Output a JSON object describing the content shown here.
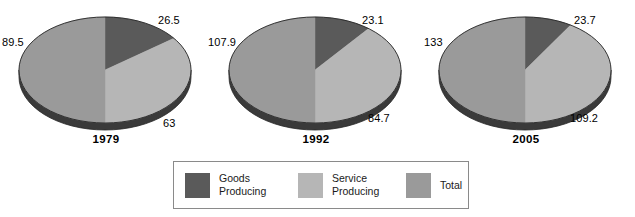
{
  "chart_data": {
    "type": "pie",
    "title": "",
    "subtitle": "",
    "xlabel": "",
    "ylabel": "",
    "legend_position": "bottom",
    "grid": false,
    "categories": [
      "Goods Producing",
      "Service Producing",
      "Total"
    ],
    "colors": {
      "goods_producing": "#5a5a5a",
      "service_producing": "#b6b6b6",
      "total": "#9a9a9a",
      "rim": "#3a3a3a",
      "outline": "#262626"
    },
    "charts": [
      {
        "year": "1979",
        "slices": [
          {
            "name": "Goods Producing",
            "value": 26.5,
            "label": "26.5",
            "color_key": "goods_producing"
          },
          {
            "name": "Service Producing",
            "value": 63,
            "label": "63",
            "color_key": "service_producing"
          },
          {
            "name": "Total",
            "value": 89.5,
            "label": "89.5",
            "color_key": "total"
          }
        ]
      },
      {
        "year": "1992",
        "slices": [
          {
            "name": "Goods Producing",
            "value": 23.1,
            "label": "23.1",
            "color_key": "goods_producing"
          },
          {
            "name": "Service Producing",
            "value": 84.7,
            "label": "84.7",
            "color_key": "service_producing"
          },
          {
            "name": "Total",
            "value": 107.9,
            "label": "107.9",
            "color_key": "total"
          }
        ]
      },
      {
        "year": "2005",
        "slices": [
          {
            "name": "Goods Producing",
            "value": 23.7,
            "label": "23.7",
            "color_key": "goods_producing"
          },
          {
            "name": "Service Producing",
            "value": 109.2,
            "label": "109.2",
            "color_key": "service_producing"
          },
          {
            "name": "Total",
            "value": 133,
            "label": "133",
            "color_key": "total"
          }
        ]
      }
    ]
  },
  "legend": {
    "items": [
      {
        "label_line1": "Goods",
        "label_line2": "Producing",
        "color_key": "goods_producing"
      },
      {
        "label_line1": "Service",
        "label_line2": "Producing",
        "color_key": "service_producing"
      },
      {
        "label_line1": "Total",
        "label_line2": "",
        "color_key": "total"
      }
    ]
  }
}
